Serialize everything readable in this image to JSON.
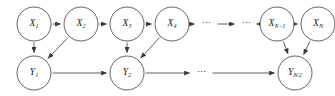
{
  "diagram": {
    "type": "directed-graph",
    "stroke_color": "#3a3a3a",
    "text_color": "#1a1a1a",
    "background_color": "#ffffff",
    "ellipsis_glyph": "⋯",
    "nodes": [
      {
        "id": "x1",
        "base": "X",
        "sub": "1",
        "cx": 34,
        "cy": 24,
        "r": 17,
        "row": "top"
      },
      {
        "id": "x2",
        "base": "X",
        "sub": "2",
        "cx": 81,
        "cy": 24,
        "r": 17,
        "row": "top"
      },
      {
        "id": "x3",
        "base": "X",
        "sub": "3",
        "cx": 127,
        "cy": 24,
        "r": 17,
        "row": "top"
      },
      {
        "id": "x4",
        "base": "X",
        "sub": "4",
        "cx": 172,
        "cy": 24,
        "r": 17,
        "row": "top"
      },
      {
        "id": "xn1",
        "base": "X",
        "sub": "N−1",
        "cx": 277,
        "cy": 24,
        "r": 17,
        "row": "top"
      },
      {
        "id": "xn",
        "base": "X",
        "sub": "N",
        "cx": 318,
        "cy": 24,
        "r": 17,
        "row": "top"
      },
      {
        "id": "y1",
        "base": "Y",
        "sub": "1",
        "cx": 34,
        "cy": 73,
        "r": 17,
        "row": "bottom"
      },
      {
        "id": "y2",
        "base": "Y",
        "sub": "2",
        "cx": 127,
        "cy": 73,
        "r": 17,
        "row": "bottom"
      },
      {
        "id": "yn2",
        "base": "Y",
        "sub": "N/2",
        "cx": 295,
        "cy": 73,
        "r": 17,
        "row": "bottom"
      }
    ],
    "ellipses": [
      {
        "id": "top-dots-1",
        "x": 207,
        "y": 24
      },
      {
        "id": "top-dots-2",
        "x": 247,
        "y": 24
      },
      {
        "id": "bottom-dots-1",
        "x": 202,
        "y": 73
      }
    ],
    "edges": [
      {
        "id": "x1-x2",
        "from": "x1",
        "to": "x2",
        "kind": "horizontal"
      },
      {
        "id": "x2-x3",
        "from": "x2",
        "to": "x3",
        "kind": "horizontal"
      },
      {
        "id": "x3-x4",
        "from": "x3",
        "to": "x4",
        "kind": "horizontal"
      },
      {
        "id": "x4-dots",
        "from": "x4",
        "to": "top-dots-1",
        "kind": "horizontal"
      },
      {
        "id": "dots-dots",
        "from": "top-dots-1",
        "to": "top-dots-2",
        "kind": "horizontal"
      },
      {
        "id": "dots-xn1",
        "from": "top-dots-2",
        "to": "xn1",
        "kind": "horizontal"
      },
      {
        "id": "xn1-xn",
        "from": "xn1",
        "to": "xn",
        "kind": "horizontal"
      },
      {
        "id": "x1-y1",
        "from": "x1",
        "to": "y1",
        "kind": "vertical"
      },
      {
        "id": "x2-y1",
        "from": "x2",
        "to": "y1",
        "kind": "diagonal"
      },
      {
        "id": "x3-y2",
        "from": "x3",
        "to": "y2",
        "kind": "vertical"
      },
      {
        "id": "x4-y2",
        "from": "x4",
        "to": "y2",
        "kind": "diagonal"
      },
      {
        "id": "xn1-yn2",
        "from": "xn1",
        "to": "yn2",
        "kind": "vertical"
      },
      {
        "id": "xn-yn2",
        "from": "xn",
        "to": "yn2",
        "kind": "diagonal"
      },
      {
        "id": "y1-y2",
        "from": "y1",
        "to": "y2",
        "kind": "horizontal"
      },
      {
        "id": "y2-dots",
        "from": "y2",
        "to": "bottom-dots-1",
        "kind": "horizontal"
      },
      {
        "id": "dots-yn2",
        "from": "bottom-dots-1",
        "to": "yn2",
        "kind": "horizontal"
      }
    ]
  }
}
